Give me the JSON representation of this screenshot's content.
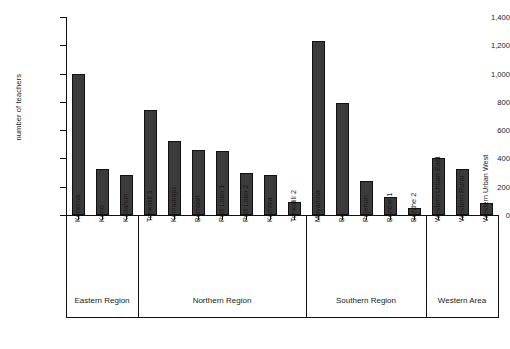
{
  "chart_data": {
    "type": "bar",
    "title": "",
    "subtitle": "",
    "xlabel": "",
    "ylabel": "number of teachers",
    "ylim": [
      0,
      1400
    ],
    "ytick_step": 200,
    "yticks": [
      0,
      200,
      400,
      600,
      800,
      1000,
      1200,
      1400
    ],
    "ytick_labels": [
      "0",
      "200",
      "400",
      "600",
      "800",
      "1,000",
      "1,200",
      "1,400"
    ],
    "grid": false,
    "legend": null,
    "bar_color": "#3b3b3b",
    "axis_color": "#111111",
    "categories": [
      "Kenema",
      "Kono",
      "Kailahun",
      "Tonkolili 1",
      "Koinadugu",
      "Bombali",
      "Port Loko 1",
      "Port Loko 2",
      "Kambia",
      "Tonkolili 2",
      "Moyamba",
      "Bo",
      "Pujehun",
      "Bonthe 1",
      "Bonthe 2",
      "Western Urban East",
      "Western Rural",
      "Western Urban West"
    ],
    "values": [
      1000,
      325,
      285,
      740,
      520,
      460,
      450,
      295,
      285,
      90,
      1230,
      790,
      240,
      125,
      50,
      400,
      325,
      85
    ],
    "groups": [
      {
        "label": "Eastern Region",
        "start": 0,
        "count": 3
      },
      {
        "label": "Northern Region",
        "start": 3,
        "count": 7
      },
      {
        "label": "Southern Region",
        "start": 10,
        "count": 5
      },
      {
        "label": "Western Area",
        "start": 15,
        "count": 3
      }
    ]
  }
}
